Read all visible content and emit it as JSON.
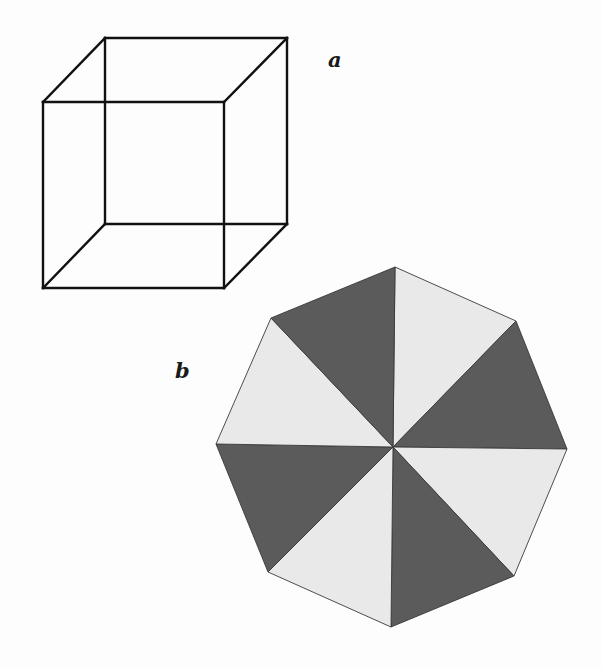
{
  "figure": {
    "panels": [
      {
        "id": "a",
        "label": "a",
        "type": "necker-cube",
        "description": "Wire-frame cube drawing (ambiguous figure)",
        "stroke_color": "#111111",
        "stroke_width": 2.4,
        "vertices": {
          "front_top_left": [
            43,
            102
          ],
          "front_top_right": [
            224,
            102
          ],
          "front_bottom_left": [
            43,
            288
          ],
          "front_bottom_right": [
            224,
            288
          ],
          "back_top_left": [
            105,
            38
          ],
          "back_top_right": [
            287,
            38
          ],
          "back_bottom_left": [
            105,
            224
          ],
          "back_bottom_right": [
            287,
            224
          ]
        }
      },
      {
        "id": "b",
        "label": "b",
        "type": "octagon-sectors",
        "description": "Regular octagon divided into 8 triangular sectors, alternately dark and light",
        "center": [
          393,
          447
        ],
        "vertices": [
          [
            395,
            267
          ],
          [
            516,
            321
          ],
          [
            567,
            449
          ],
          [
            514,
            576
          ],
          [
            391,
            627
          ],
          [
            268,
            572
          ],
          [
            216,
            444
          ],
          [
            271,
            318
          ]
        ],
        "sector_shades": [
          "light",
          "dark",
          "light",
          "dark",
          "light",
          "dark",
          "light",
          "dark"
        ],
        "colors": {
          "dark": "#5b5b5b",
          "light": "#e9e9e9",
          "edge": "#3a3a3a"
        }
      }
    ]
  }
}
